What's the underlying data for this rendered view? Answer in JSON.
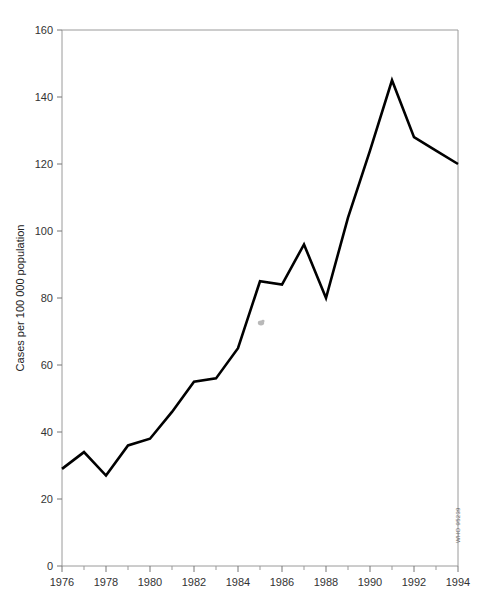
{
  "chart_data": {
    "type": "line",
    "title": "",
    "subtitle": "",
    "xlabel": "",
    "ylabel": "Cases per 100 000 population",
    "xlim": [
      1976,
      1994
    ],
    "ylim": [
      0,
      160
    ],
    "grid": false,
    "legend": null,
    "x": [
      1976,
      1977,
      1978,
      1979,
      1980,
      1981,
      1982,
      1983,
      1984,
      1985,
      1986,
      1987,
      1988,
      1989,
      1990,
      1991,
      1992,
      1993,
      1994
    ],
    "values": [
      29,
      34,
      27,
      36,
      38,
      46,
      55,
      56,
      65,
      85,
      84,
      96,
      80,
      104,
      124,
      145,
      128,
      124,
      120
    ],
    "series": [
      {
        "name": "Cases per 100 000 population",
        "color": "#000000",
        "values": [
          29,
          34,
          27,
          36,
          38,
          46,
          55,
          56,
          65,
          85,
          84,
          96,
          80,
          104,
          124,
          145,
          128,
          124,
          120
        ]
      }
    ],
    "y_ticks": [
      0,
      20,
      40,
      60,
      80,
      100,
      120,
      140,
      160
    ],
    "y_tick_labels": [
      "0",
      "20",
      "40",
      "60",
      "80",
      "100",
      "120",
      "140",
      "160"
    ],
    "x_ticks_major": [
      1976,
      1978,
      1980,
      1982,
      1984,
      1986,
      1988,
      1990,
      1992,
      1994
    ],
    "x_tick_labels": [
      "1976",
      "1978",
      "1980",
      "1982",
      "1984",
      "1986",
      "1988",
      "1990",
      "1992",
      "1994"
    ],
    "x_ticks_minor": [
      1977,
      1979,
      1981,
      1983,
      1985,
      1987,
      1989,
      1991,
      1993
    ],
    "annotations": [
      {
        "name": "source-code",
        "text": "WHO 95239",
        "orientation": "vertical"
      }
    ],
    "colors": {
      "line": "#000000",
      "frame": "#9a9a9a",
      "text": "#333333",
      "background": "#ffffff"
    }
  }
}
